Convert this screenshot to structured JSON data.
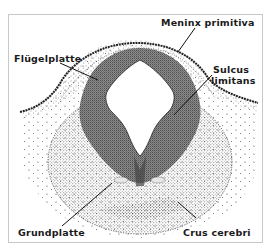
{
  "figure": {
    "labels": {
      "meninx": "Meninx primitiva",
      "fluegelplatte": "Flügelplatte",
      "sulcus_line1": "Sulcus",
      "sulcus_line2": "limitans",
      "grundplatte": "Grundplatte",
      "crus": "Crus cerebri"
    },
    "colors": {
      "ink": "#1a1a1a",
      "frame": "#c8c8c8",
      "background": "#ffffff"
    }
  }
}
